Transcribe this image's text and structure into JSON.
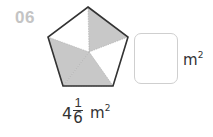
{
  "question": {
    "number": "06",
    "figure": {
      "shape": "regular-pentagon",
      "total_parts": 5,
      "shaded_parts": 3,
      "shaded_color": "#c8c8c8",
      "outline_color": "#333333"
    },
    "given_area": {
      "whole": "4",
      "numerator": "1",
      "denominator": "6",
      "unit": "m",
      "unit_power": "2"
    },
    "answer": {
      "value": "",
      "unit": "m",
      "unit_power": "2"
    }
  }
}
